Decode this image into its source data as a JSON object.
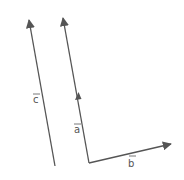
{
  "diagram": {
    "type": "vector-diagram",
    "colors": {
      "line": "#555555",
      "background": "#ffffff"
    },
    "vectors": [
      {
        "name": "c",
        "label": "c",
        "from": [
          55,
          166
        ],
        "to": [
          29,
          20
        ]
      },
      {
        "name": "a",
        "label": "a",
        "from": [
          89,
          163
        ],
        "to": [
          63,
          18
        ]
      },
      {
        "name": "b",
        "label": "b",
        "from": [
          89,
          163
        ],
        "to": [
          171,
          144
        ]
      }
    ],
    "labels": {
      "c": "c",
      "a": "a",
      "b": "b"
    }
  }
}
